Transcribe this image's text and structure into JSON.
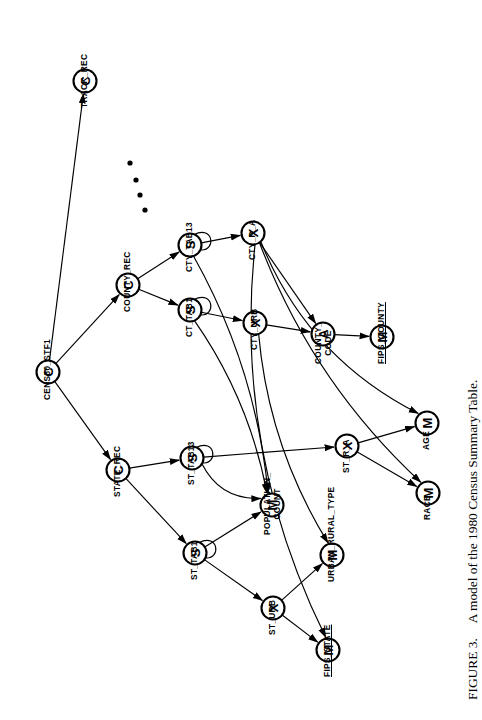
{
  "figure": {
    "caption_number": "FIGURE 3.",
    "caption_text": "A model of the 1980 Census Summary Table.",
    "caption_full": "FIGURE 3.   A model of the 1980 Census Summary Table.",
    "orientation": "rotated 90 degrees counter-clockwise",
    "type": "entity-relationship / data-structure diagram"
  },
  "legend": {
    "node_types": {
      "C": "composite / record node",
      "S": "set node",
      "X": "cross-product node",
      "A": "aggregate node",
      "M": "measure / data item node"
    }
  },
  "nodes": [
    {
      "id": "cens80_stf1",
      "label": "CENS80_STF1",
      "glyph": "C",
      "x": 48,
      "y": 372,
      "lx": 42,
      "ly": 400,
      "underline": false
    },
    {
      "id": "track_rec",
      "label": "TRACK_REC",
      "glyph": "C",
      "x": 85,
      "y": 81,
      "lx": 79,
      "ly": 108,
      "underline": false
    },
    {
      "id": "county_rec",
      "label": "COUNTY_REC",
      "glyph": "C",
      "x": 128,
      "y": 285,
      "lx": 122,
      "ly": 312,
      "underline": false
    },
    {
      "id": "state_rec",
      "label": "STATE_REC",
      "glyph": "C",
      "x": 118,
      "y": 470,
      "lx": 112,
      "ly": 497,
      "underline": false
    },
    {
      "id": "cty_tab13",
      "label": "CTY_TAB13",
      "glyph": "S",
      "x": 190,
      "y": 245,
      "lx": 184,
      "ly": 272,
      "underline": false
    },
    {
      "id": "ct_tab1",
      "label": "CT_TAB1",
      "glyph": "S",
      "x": 190,
      "y": 310,
      "lx": 184,
      "ly": 337,
      "underline": false
    },
    {
      "id": "st_tab13",
      "label": "ST_TAB13",
      "glyph": "S",
      "x": 192,
      "y": 458,
      "lx": 186,
      "ly": 485,
      "underline": false
    },
    {
      "id": "st_tab1",
      "label": "ST_TAB1",
      "glyph": "S",
      "x": 195,
      "y": 553,
      "lx": 189,
      "ly": 580,
      "underline": false
    },
    {
      "id": "cty_r_a",
      "label": "CTY_R_A",
      "glyph": "X",
      "x": 253,
      "y": 233,
      "lx": 247,
      "ly": 260,
      "underline": false
    },
    {
      "id": "cty_urb",
      "label": "CTY_URB",
      "glyph": "X",
      "x": 255,
      "y": 323,
      "lx": 249,
      "ly": 350,
      "underline": false
    },
    {
      "id": "st_r_a",
      "label": "ST_R_A",
      "glyph": "X",
      "x": 347,
      "y": 446,
      "lx": 341,
      "ly": 473,
      "underline": false
    },
    {
      "id": "st_urb",
      "label": "ST_URB",
      "glyph": "X",
      "x": 273,
      "y": 608,
      "lx": 267,
      "ly": 635,
      "underline": false
    },
    {
      "id": "county_code",
      "label": "COUNTY_ CODE",
      "glyph": "A",
      "x": 323,
      "y": 334,
      "lx": 313,
      "ly": 364,
      "underline": false
    },
    {
      "id": "fips_county",
      "label": "FIPS_COUNTY",
      "glyph": "M",
      "x": 382,
      "y": 337,
      "lx": 376,
      "ly": 364,
      "underline": true
    },
    {
      "id": "age",
      "label": "AGE",
      "glyph": "M",
      "x": 427,
      "y": 423,
      "lx": 421,
      "ly": 450,
      "underline": false
    },
    {
      "id": "race",
      "label": "RACE",
      "glyph": "M",
      "x": 428,
      "y": 493,
      "lx": 422,
      "ly": 520,
      "underline": false
    },
    {
      "id": "population_count",
      "label": "POPULATION_ COUNT",
      "glyph": "M",
      "x": 272,
      "y": 505,
      "lx": 262,
      "ly": 535,
      "underline": false
    },
    {
      "id": "urban_rural_type",
      "label": "URBAN_RURAL_TYPE",
      "glyph": "M",
      "x": 332,
      "y": 555,
      "lx": 326,
      "ly": 582,
      "underline": false
    },
    {
      "id": "fips_state",
      "label": "FIPS_STATE",
      "glyph": "M",
      "x": 328,
      "y": 650,
      "lx": 322,
      "ly": 677,
      "underline": true
    }
  ],
  "ellipsis_dots": [
    {
      "x": 130,
      "y": 163
    },
    {
      "x": 136,
      "y": 180
    },
    {
      "x": 140,
      "y": 195
    },
    {
      "x": 145,
      "y": 210
    }
  ],
  "edges": [
    {
      "from": "cens80_stf1",
      "to": "track_rec"
    },
    {
      "from": "cens80_stf1",
      "to": "county_rec"
    },
    {
      "from": "cens80_stf1",
      "to": "state_rec"
    },
    {
      "from": "county_rec",
      "to": "cty_tab13"
    },
    {
      "from": "county_rec",
      "to": "ct_tab1"
    },
    {
      "from": "state_rec",
      "to": "st_tab13"
    },
    {
      "from": "state_rec",
      "to": "st_tab1"
    },
    {
      "from": "cty_tab13",
      "to": "cty_r_a"
    },
    {
      "from": "ct_tab1",
      "to": "cty_urb"
    },
    {
      "from": "st_tab13",
      "to": "st_r_a"
    },
    {
      "from": "st_tab1",
      "to": "st_urb"
    },
    {
      "from": "cty_urb",
      "to": "county_code"
    },
    {
      "from": "cty_r_a",
      "to": "county_code"
    },
    {
      "from": "county_code",
      "to": "fips_county"
    },
    {
      "from": "cty_r_a",
      "to": "age"
    },
    {
      "from": "cty_r_a",
      "to": "race"
    },
    {
      "from": "st_r_a",
      "to": "age"
    },
    {
      "from": "st_r_a",
      "to": "race"
    },
    {
      "from": "cty_tab13",
      "to": "population_count"
    },
    {
      "from": "ct_tab1",
      "to": "population_count"
    },
    {
      "from": "st_tab13",
      "to": "population_count"
    },
    {
      "from": "st_tab1",
      "to": "population_count"
    },
    {
      "from": "st_urb",
      "to": "urban_rural_type"
    },
    {
      "from": "cty_urb",
      "to": "urban_rural_type"
    },
    {
      "from": "st_urb",
      "to": "fips_state"
    },
    {
      "from": "cty_r_a",
      "to": "fips_state"
    }
  ],
  "self_loops": [
    "cty_tab13",
    "ct_tab1",
    "st_tab13",
    "st_tab1"
  ]
}
